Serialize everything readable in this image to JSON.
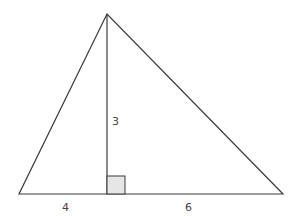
{
  "diagram": {
    "type": "triangle-with-altitude",
    "labels": {
      "height": "3",
      "left_base_segment": "4",
      "right_base_segment": "6"
    },
    "colors": {
      "line": "#3a3a3a",
      "right_angle_fill": "#e6e6e6"
    }
  }
}
